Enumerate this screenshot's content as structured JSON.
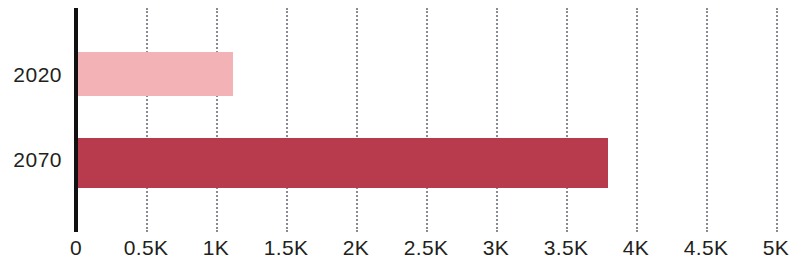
{
  "chart_data": {
    "type": "bar",
    "orientation": "horizontal",
    "title": "",
    "subtitle": "",
    "xlabel": "",
    "ylabel": "",
    "categories": [
      "2020",
      "2070"
    ],
    "values": [
      1120,
      3800
    ],
    "series": [
      {
        "name": "",
        "values": [
          1120,
          3800
        ]
      }
    ],
    "bar_colors": [
      "#f3b3b6",
      "#b73b4c"
    ],
    "xlim": [
      0,
      5000
    ],
    "ylim": null,
    "xticks": [
      0,
      500,
      1000,
      1500,
      2000,
      2500,
      3000,
      3500,
      4000,
      4500,
      5000
    ],
    "xtick_labels": [
      "0",
      "0.5K",
      "1K",
      "1.5K",
      "2K",
      "2.5K",
      "3K",
      "3.5K",
      "4K",
      "4.5K",
      "5K"
    ],
    "grid": "vertical-dotted",
    "legend": null,
    "legend_position": "none",
    "annotations": [],
    "axis_line_color": "#111111",
    "gridline_color": "#8a8a92",
    "background_color": "#ffffff",
    "text_color": "#231f20"
  },
  "axis": {
    "y_categories": [
      {
        "label": "2020"
      },
      {
        "label": "2070"
      }
    ],
    "x_ticks": [
      {
        "label": "0",
        "value": 0
      },
      {
        "label": "0.5K",
        "value": 500
      },
      {
        "label": "1K",
        "value": 1000
      },
      {
        "label": "1.5K",
        "value": 1500
      },
      {
        "label": "2K",
        "value": 2000
      },
      {
        "label": "2.5K",
        "value": 2500
      },
      {
        "label": "3K",
        "value": 3000
      },
      {
        "label": "3.5K",
        "value": 3500
      },
      {
        "label": "4K",
        "value": 4000
      },
      {
        "label": "4.5K",
        "value": 4500
      },
      {
        "label": "5K",
        "value": 5000
      }
    ]
  }
}
